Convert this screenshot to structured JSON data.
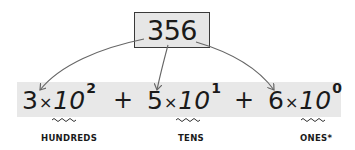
{
  "number": "356",
  "terms": [
    {
      "digit": "3",
      "times": "×",
      "base": "10",
      "exponent": "2",
      "label": "HUNDREDS"
    },
    {
      "digit": "5",
      "times": "×",
      "base": "10",
      "exponent": "1",
      "label": "TENS"
    },
    {
      "digit": "6",
      "times": "×",
      "base": "10",
      "exponent": "0",
      "label": "ONES*"
    }
  ],
  "operators": [
    "+",
    "+"
  ],
  "colors": {
    "box_fill": "#e6e6e6",
    "band_fill": "#e8e8e8",
    "arrow": "#666666",
    "text": "#1a1a1a"
  }
}
